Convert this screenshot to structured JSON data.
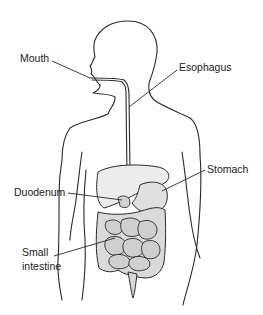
{
  "diagram": {
    "labels": {
      "mouth": "Mouth",
      "esophagus": "Esophagus",
      "stomach": "Stomach",
      "duodenum": "Duodenum",
      "small_intestine_line1": "Small",
      "small_intestine_line2": "intestine"
    },
    "colors": {
      "outline": "#2a2a2a",
      "organ_fill": "#e6e6e6",
      "intestine_fill": "#d6d6d6",
      "background": "#ffffff"
    }
  }
}
